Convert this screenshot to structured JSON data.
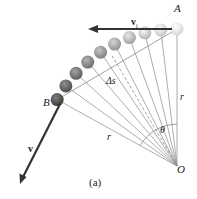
{
  "figure": {
    "caption": "(a)",
    "labels": {
      "point_a": "A",
      "point_b": "B",
      "origin": "O",
      "radius_vertical": "r",
      "radius_b": "r",
      "angle": "θ",
      "arc_length": "Δs",
      "velocity_initial": "v",
      "velocity_initial_subscript": "i",
      "velocity": "v"
    },
    "colors": {
      "line": "#8a8a8a",
      "arrow": "#333333",
      "ball_light": "#d6d6d6",
      "ball_dark": "#3a3a3a",
      "text": "#222222"
    },
    "geometry": {
      "origin": [
        177,
        166
      ],
      "radius": 137,
      "start_angle_deg": 90,
      "end_angle_deg": 151,
      "ball_count": 10,
      "ball_radius": 6.5
    }
  }
}
